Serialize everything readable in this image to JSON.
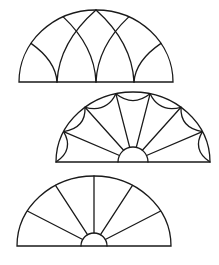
{
  "figure": {
    "designs": [
      {
        "name": "gothic-arches",
        "arches": 4
      },
      {
        "name": "scalloped-sunburst",
        "segments": 7
      },
      {
        "name": "plain-sunburst",
        "segments": 6
      }
    ],
    "stroke_color": "#1a1a1a",
    "background_color": "#ffffff"
  }
}
